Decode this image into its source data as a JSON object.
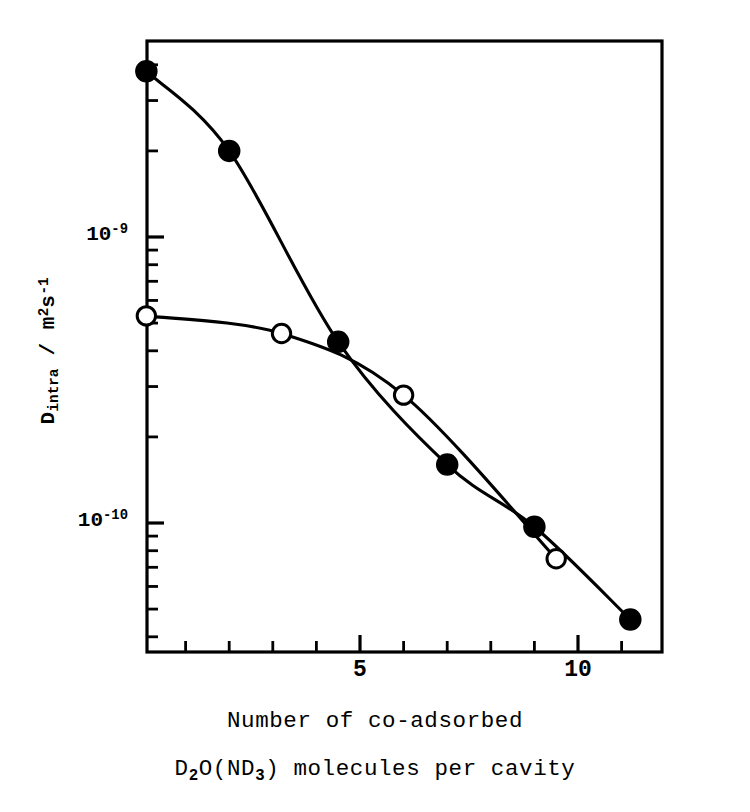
{
  "figure": {
    "background_color": "#ffffff",
    "ink_color": "#000000"
  },
  "axes": {
    "y_label_prefix": "D",
    "y_label_subscript": "intra",
    "y_label_separator": " / ",
    "y_label_units_m": "m",
    "y_label_units_m_exp": "2",
    "y_label_units_s": "s",
    "y_label_units_s_exp": "-1",
    "y_label_plain": "D_intra / m^2 s^-1",
    "y_scale": "log",
    "y_major_ticks": [
      {
        "value": 1e-09,
        "mantissa": "10",
        "exponent": "-9"
      },
      {
        "value": 1e-10,
        "mantissa": "10",
        "exponent": "-10"
      }
    ],
    "x_scale": "linear",
    "x_major_ticks": [
      {
        "value": 5,
        "label": "5"
      },
      {
        "value": 10,
        "label": "10"
      }
    ],
    "x_minor_tick_values": [
      1,
      2,
      3,
      4,
      6,
      7,
      8,
      9,
      11,
      12
    ],
    "x_range": [
      -0.12,
      11.95
    ],
    "y_range": [
      2.7e-11,
      6.3e-09
    ],
    "frame": "box",
    "grid": "off"
  },
  "caption": {
    "line1": "Number of co-adsorbed",
    "line2_part1": "D",
    "line2_sub1": "2",
    "line2_part2": "O(ND",
    "line2_sub2": "3",
    "line2_part3": ") molecules per cavity",
    "line2_plain": "D2O(ND3) molecules per cavity",
    "full_text": "Number of co-adsorbed D2O(ND3) molecules per cavity"
  },
  "chart_data": {
    "type": "line",
    "title": "",
    "xlabel": "Number of co-adsorbed D2O(ND3) molecules per cavity",
    "ylabel": "D_intra / m^2 s^-1",
    "xscale": "linear",
    "yscale": "log",
    "xlim": [
      -0.12,
      11.95
    ],
    "ylim": [
      2.7e-11,
      6.3e-09
    ],
    "grid": false,
    "legend": "none",
    "series": [
      {
        "name": "filled-circles",
        "marker": "filled-circle",
        "marker_color": "#000000",
        "line_color": "#000000",
        "x": [
          0.1,
          2.0,
          4.5,
          7.0,
          9.0,
          11.2
        ],
        "y": [
          3.8e-09,
          2e-09,
          4.3e-10,
          1.6e-10,
          9.7e-11,
          4.6e-11
        ]
      },
      {
        "name": "open-circles",
        "marker": "open-circle",
        "marker_color": "#ffffff",
        "line_color": "#000000",
        "x": [
          0.1,
          3.2,
          6.0,
          9.5
        ],
        "y": [
          5.3e-10,
          4.6e-10,
          2.8e-10,
          7.5e-11
        ]
      }
    ]
  }
}
